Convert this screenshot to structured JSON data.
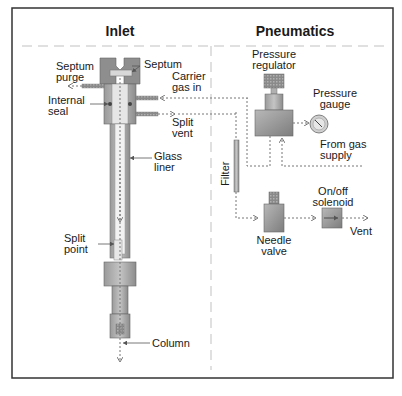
{
  "sections": {
    "inlet": {
      "title": "Inlet"
    },
    "pneumatics": {
      "title": "Pneumatics"
    }
  },
  "labels": {
    "septum_purge": [
      "Septum",
      "purge"
    ],
    "septum": "Septum",
    "carrier_gas_in": [
      "Carrier",
      "gas in"
    ],
    "internal_seal": [
      "Internal",
      "seal"
    ],
    "split_vent": [
      "Split",
      "vent"
    ],
    "glass_liner": [
      "Glass",
      "liner"
    ],
    "split_point": [
      "Split",
      "point"
    ],
    "column": "Column",
    "pressure_regulator": [
      "Pressure",
      "regulator"
    ],
    "pressure_gauge": [
      "Pressure",
      "gauge"
    ],
    "from_gas_supply": [
      "From gas",
      "supply"
    ],
    "filter": "Filter",
    "on_off_solenoid": [
      "On/off",
      "solenoid"
    ],
    "needle_valve": [
      "Needle",
      "valve"
    ],
    "vent": "Vent"
  },
  "colors": {
    "frame": "#333333",
    "component_dark": "#8a8a8a",
    "component_mid": "#b5b5b5",
    "component_light": "#d0d0d0",
    "flow_line": "#777777",
    "divider": "#d6d6d6",
    "text": "#1a1a1a"
  }
}
